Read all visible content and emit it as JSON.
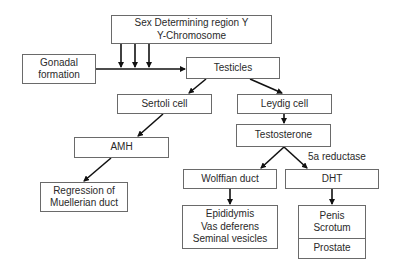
{
  "nodes": {
    "sry": {
      "lines": [
        "Sex Determining region Y",
        "Y-Chromosome"
      ]
    },
    "gonadal": {
      "lines": [
        "Gonadal",
        "formation"
      ]
    },
    "testicles": {
      "label": "Testicles"
    },
    "sertoli": {
      "label": "Sertoli cell"
    },
    "leydig": {
      "label": "Leydig cell"
    },
    "testosterone": {
      "label": "Testosterone"
    },
    "amh": {
      "label": "AMH"
    },
    "regression": {
      "lines": [
        "Regression of",
        "Muellerian duct"
      ]
    },
    "wolffian": {
      "label": "Wolffian duct"
    },
    "dht": {
      "label": "DHT"
    },
    "wolffian_derivatives": {
      "lines": [
        "Epididymis",
        "Vas deferens",
        "Seminal vesicles"
      ]
    },
    "dht_derivatives": {
      "lines": [
        "Penis",
        "Scrotum"
      ],
      "bottom": "Prostate"
    }
  },
  "edge_labels": {
    "five_alpha_reductase": "5a reductase"
  },
  "edges": [
    {
      "from": "sry",
      "to": "gonadal_arrow",
      "count": 3
    },
    {
      "from": "gonadal",
      "to": "testicles"
    },
    {
      "from": "testicles",
      "to": "sertoli"
    },
    {
      "from": "testicles",
      "to": "leydig"
    },
    {
      "from": "sertoli",
      "to": "amh"
    },
    {
      "from": "amh",
      "to": "regression"
    },
    {
      "from": "leydig",
      "to": "testosterone"
    },
    {
      "from": "testosterone",
      "to": "wolffian"
    },
    {
      "from": "testosterone",
      "to": "dht",
      "label": "5a reductase"
    },
    {
      "from": "wolffian",
      "to": "wolffian_derivatives"
    },
    {
      "from": "dht",
      "to": "dht_derivatives"
    }
  ],
  "colors": {
    "line": "#111111",
    "border": "#6a6a6a",
    "text": "#2a2a2a"
  }
}
